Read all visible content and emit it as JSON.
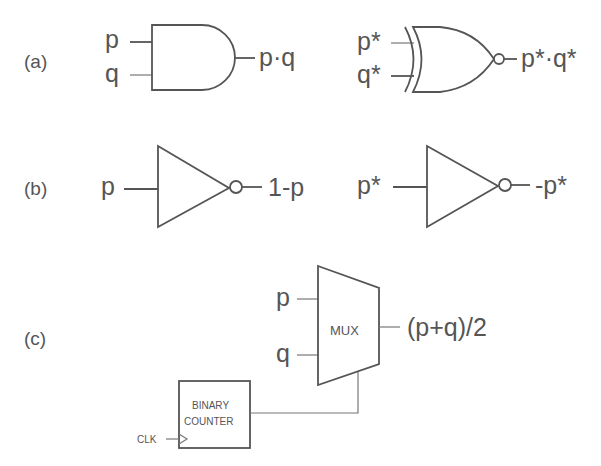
{
  "panels": {
    "a": {
      "label": "(a)",
      "and_gate": {
        "inputs": [
          "p",
          "q"
        ],
        "output": "p·q"
      },
      "xnor_gate": {
        "inputs": [
          "p*",
          "q*"
        ],
        "output": "p*·q*"
      }
    },
    "b": {
      "label": "(b)",
      "inverter_1": {
        "input": "p",
        "output": "1-p"
      },
      "inverter_2": {
        "input": "p*",
        "output": "-p*"
      }
    },
    "c": {
      "label": "(c)",
      "mux": {
        "label": "MUX",
        "inputs": [
          "p",
          "q"
        ],
        "output": "(p+q)/2"
      },
      "counter": {
        "line1": "BINARY",
        "line2": "COUNTER",
        "clock": "CLK"
      }
    }
  }
}
